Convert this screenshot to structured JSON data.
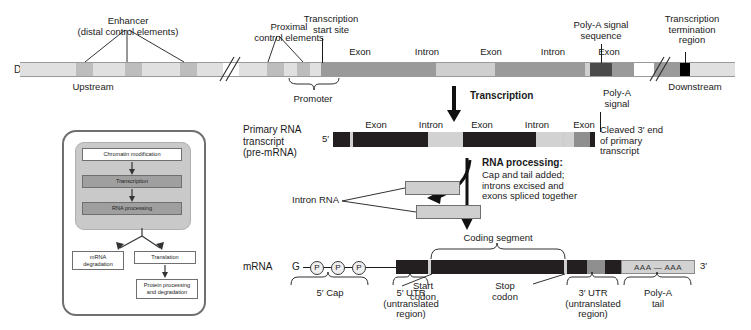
{
  "figure": {
    "rows": {
      "dna_label": "DNA",
      "premrna_label": "Primary RNA\ntranscript\n(pre-mRNA)",
      "mrna_label": "mRNA"
    },
    "dna": {
      "callouts": {
        "enhancer": "Enhancer\n(distal control elements)",
        "proximal": "Proximal\ncontrol elements",
        "start_site": "Transcription\nstart site",
        "polya_signal_sequence": "Poly-A signal\nsequence",
        "termination": "Transcription\ntermination\nregion"
      },
      "below": {
        "upstream": "Upstream",
        "promoter": "Promoter",
        "downstream": "Downstream"
      },
      "segments": [
        {
          "name": "Exon",
          "type": "exon"
        },
        {
          "name": "Intron",
          "type": "intron"
        },
        {
          "name": "Exon",
          "type": "exon"
        },
        {
          "name": "Intron",
          "type": "intron"
        },
        {
          "name": "Exon",
          "type": "exon"
        }
      ]
    },
    "steps": {
      "transcription": "Transcription",
      "rna_processing_title": "RNA processing:",
      "rna_processing_body": "Cap and tail added;\nintrons excised and\nexons spliced together"
    },
    "premrna": {
      "five_prime": "5′",
      "polya_signal": "Poly-A\nsignal",
      "cleaved": "Cleaved 3′ end\nof primary\ntranscript",
      "segments": [
        {
          "name": "Exon",
          "type": "exon"
        },
        {
          "name": "Intron",
          "type": "intron"
        },
        {
          "name": "Exon",
          "type": "exon"
        },
        {
          "name": "Intron",
          "type": "intron"
        },
        {
          "name": "Exon",
          "type": "exon"
        }
      ]
    },
    "intron_rna_label": "Intron RNA",
    "mrna": {
      "cap_g": "G",
      "cap_p": "P",
      "three_prime": "3′",
      "polya_tail_text": "AAA — AAA",
      "coding_segment": "Coding segment",
      "start_codon": "Start\ncodon",
      "stop_codon": "Stop\ncodon",
      "five_cap": "5′ Cap",
      "five_utr": "5′ UTR\n(untranslated\nregion)",
      "three_utr": "3′ UTR\n(untranslated\nregion)",
      "polya_tail": "Poly-A\ntail"
    },
    "inset": {
      "chromatin_modification": "Chromatin modification",
      "transcription": "Transcription",
      "rna_processing": "RNA processing",
      "mrna_degradation": "mRNA\ndegradation",
      "translation": "Translation",
      "protein_processing": "Protein processing\nand degradation"
    },
    "colors": {
      "dna_backbone": "#e0e0e0",
      "control_element": "#bdbdbd",
      "exon_dna": "#9a9a9a",
      "intron_dna": "#cfcfcf",
      "polya_signal_dna": "#4a4a4a",
      "termination_block": "#000000",
      "rna_dark": "#231f20",
      "rna_intron": "#d2d2d2",
      "inset_panel": "#c9c9c9"
    }
  }
}
